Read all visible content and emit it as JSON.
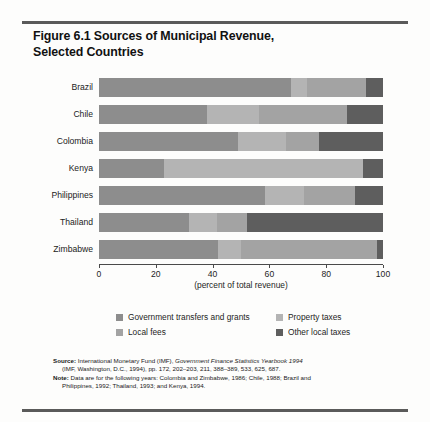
{
  "figure": {
    "title_line1": "Figure 6.1  Sources of Municipal Revenue,",
    "title_line2": "Selected Countries"
  },
  "chart_data": {
    "type": "bar",
    "orientation": "horizontal",
    "stacked": true,
    "title": "Figure 6.1  Sources of Municipal Revenue, Selected Countries",
    "xlabel": "(percent of total revenue)",
    "ylabel": "",
    "xlim": [
      0,
      100
    ],
    "xticks": [
      0,
      20,
      40,
      60,
      80,
      100
    ],
    "xticklabels": [
      "0",
      "20",
      "40",
      "60",
      "80",
      "100"
    ],
    "grid": false,
    "legend_position": "bottom",
    "categories": [
      "Brazil",
      "Chile",
      "Colombia",
      "Kenya",
      "Philippines",
      "Thailand",
      "Zimbabwe"
    ],
    "series": [
      {
        "name": "Government transfers and grants",
        "color": "#8d8d8d",
        "values": [
          67.6,
          38.0,
          49.0,
          23.0,
          58.6,
          31.6,
          42.0
        ]
      },
      {
        "name": "Property taxes",
        "color": "#b4b4b4",
        "values": [
          5.6,
          18.2,
          16.9,
          70.0,
          13.5,
          10.0,
          7.9
        ]
      },
      {
        "name": "Local fees",
        "color": "#a3a3a3",
        "values": [
          20.8,
          31.0,
          11.4,
          0.0,
          17.9,
          10.5,
          48.1
        ]
      },
      {
        "name": "Other local taxes",
        "color": "#5e5e5e",
        "values": [
          6.0,
          12.8,
          22.7,
          7.0,
          10.0,
          47.9,
          2.0
        ]
      }
    ]
  },
  "legend": {
    "items": [
      {
        "label": "Government transfers and grants",
        "color": "#8d8d8d",
        "swatch": "swatch-gov-transfers"
      },
      {
        "label": "Property taxes",
        "color": "#b4b4b4",
        "swatch": "swatch-property-taxes"
      },
      {
        "label": "Local fees",
        "color": "#a3a3a3",
        "swatch": "swatch-local-fees"
      },
      {
        "label": "Other local taxes",
        "color": "#5e5e5e",
        "swatch": "swatch-other-local-taxes"
      }
    ]
  },
  "notes": {
    "source_lead": "Source:",
    "source_text_1": " International Monetary Fund (IMF), ",
    "source_italic": "Government Finance Statistics Yearbook 1994",
    "source_line2": "(IMF, Washington, D.C., 1994), pp. 172, 202–203, 211, 388–389, 533, 625, 687.",
    "note_lead": "Note:",
    "note_text_1": " Data are for  the following years: Colombia and Zimbabwe, 1986; Chile, 1988; Brazil and",
    "note_line2": "Philippines, 1992; Thailand, 1993; and Kenya, 1994."
  },
  "colors": {
    "gov_transfers": "#8d8d8d",
    "property_taxes": "#b4b4b4",
    "local_fees": "#a3a3a3",
    "other_local_taxes": "#5e5e5e",
    "rule": "#5a5a5a",
    "axis": "#4a4a4a",
    "background": "#fdfdfc"
  }
}
